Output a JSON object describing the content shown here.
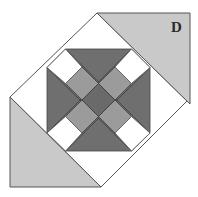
{
  "diagram": {
    "type": "quilt-block",
    "corner_label": "D",
    "colors": {
      "background": "#ffffff",
      "outline": "#555555",
      "light_gray": "#c9c9c9",
      "medium_gray": "#9b9b9b",
      "dark_gray": "#6f6f6f",
      "white": "#ffffff"
    },
    "pieces": {
      "corner_triangles": [
        "top-right",
        "bottom-left"
      ],
      "center_diamond": "dark",
      "medium_diamonds": [
        "upper-left",
        "upper-right",
        "lower-left",
        "lower-right"
      ],
      "white_diamonds": [
        "top-left",
        "top-right",
        "bottom-left",
        "bottom-right"
      ],
      "side_triangles": [
        "top",
        "right",
        "bottom",
        "left"
      ]
    }
  }
}
